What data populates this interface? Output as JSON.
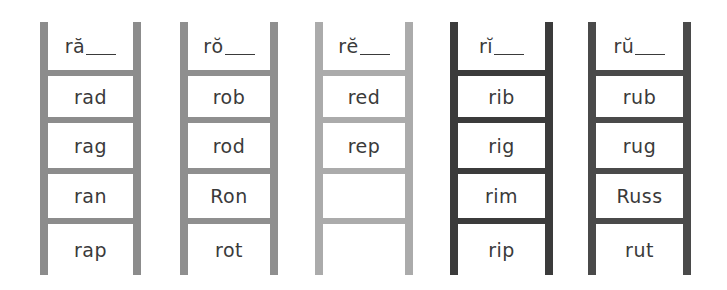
{
  "worksheet": {
    "ladders": [
      {
        "header": "ră",
        "color": "#8c8c8c",
        "words": [
          "rad",
          "rag",
          "ran",
          "rap"
        ]
      },
      {
        "header": "rŏ",
        "color": "#8f8f8f",
        "words": [
          "rob",
          "rod",
          "Ron",
          "rot"
        ]
      },
      {
        "header": "rĕ",
        "color": "#ababab",
        "words": [
          "red",
          "rep",
          "",
          ""
        ]
      },
      {
        "header": "rĭ",
        "color": "#3b3b3b",
        "words": [
          "rib",
          "rig",
          "rim",
          "rip"
        ]
      },
      {
        "header": "rŭ",
        "color": "#4a4a4a",
        "words": [
          "rub",
          "rug",
          "Russ",
          "rut"
        ]
      }
    ]
  }
}
